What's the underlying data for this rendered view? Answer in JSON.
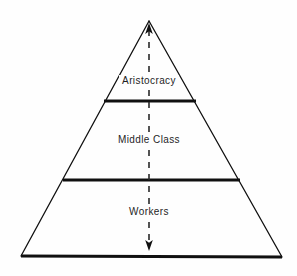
{
  "diagram": {
    "type": "social-class-pyramid",
    "background_color": "#fefefe",
    "line_color": "#101010",
    "text_color": "#1e1e1e",
    "tiers": [
      {
        "id": "aristocracy",
        "label": "Aristocracy",
        "position": "top"
      },
      {
        "id": "middle-class",
        "label": "Middle Class",
        "position": "middle"
      },
      {
        "id": "workers",
        "label": "Workers",
        "position": "bottom"
      }
    ],
    "axis": {
      "id": "mobility-axis",
      "style": "dashed",
      "orientation": "vertical",
      "arrow_top": true,
      "arrow_bottom": true
    },
    "geometry": {
      "apex": [
        149,
        21
      ],
      "base_left": [
        21,
        256
      ],
      "base_right": [
        282,
        257
      ],
      "divider_upper": [
        104,
        101,
        196,
        101
      ],
      "divider_lower": [
        63,
        180,
        240,
        180
      ],
      "axis_line": [
        149,
        24,
        149,
        250
      ]
    }
  }
}
